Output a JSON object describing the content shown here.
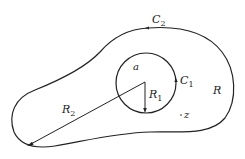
{
  "diagram": {
    "labels": {
      "outer_contour": "C",
      "outer_contour_sub": "2",
      "inner_contour": "C",
      "inner_contour_sub": "1",
      "inner_radius": "R",
      "inner_radius_sub": "1",
      "outer_radius": "R",
      "outer_radius_sub": "2",
      "center_point": "a",
      "region": "R",
      "point": "z"
    },
    "colors": {
      "stroke": "#222222",
      "background": "#ffffff"
    }
  }
}
